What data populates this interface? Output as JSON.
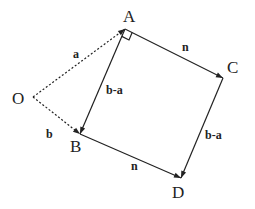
{
  "diagram": {
    "points": [
      {
        "id": "O",
        "label": "O"
      },
      {
        "id": "A",
        "label": "A"
      },
      {
        "id": "B",
        "label": "B"
      },
      {
        "id": "C",
        "label": "C"
      },
      {
        "id": "D",
        "label": "D"
      }
    ],
    "vectors": [
      {
        "from": "O",
        "to": "A",
        "label": "a",
        "style": "dashed"
      },
      {
        "from": "O",
        "to": "B",
        "label": "b",
        "style": "dashed"
      },
      {
        "from": "A",
        "to": "B",
        "label": "b-a",
        "style": "solid"
      },
      {
        "from": "A",
        "to": "C",
        "label": "n",
        "style": "solid"
      },
      {
        "from": "C",
        "to": "D",
        "label": "b-a",
        "style": "solid"
      },
      {
        "from": "B",
        "to": "D",
        "label": "n",
        "style": "solid"
      }
    ],
    "annotations": [
      {
        "type": "right-angle",
        "at": "A"
      }
    ]
  }
}
